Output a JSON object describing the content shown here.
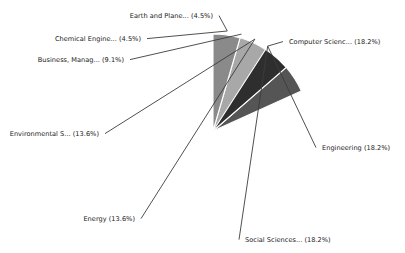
{
  "chart_data": {
    "type": "pie",
    "title": "",
    "xlabel": "",
    "ylabel": "",
    "legend_position": "none",
    "grid": false,
    "label_format": "{name} ({percent}%)",
    "total_percent": 100.0,
    "start_angle": 90,
    "direction": "clockwise",
    "categories": [
      "Computer Scienc...",
      "Engineering",
      "Social Sciences...",
      "Energy",
      "Environmental S...",
      "Business, Manag...",
      "Chemical Engine...",
      "Earth and Plane..."
    ],
    "values": [
      18.2,
      18.2,
      18.2,
      13.6,
      13.6,
      9.1,
      4.5,
      4.5
    ],
    "colors": [
      "#3a3a3a",
      "#262626",
      "#555555",
      "#606060",
      "#2e2e2e",
      "#a8a8a8",
      "#111111",
      "#8a8a8a"
    ],
    "slices": [
      {
        "name": "Computer Scienc...",
        "percent": 18.2,
        "label": "Computer Scienc... (18.2%)",
        "color": "#3a3a3a",
        "label_x": 289,
        "label_y": 44,
        "label_align": "start"
      },
      {
        "name": "Engineering",
        "percent": 18.2,
        "label": "Engineering (18.2%)",
        "color": "#262626",
        "label_x": 322,
        "label_y": 150,
        "label_align": "start"
      },
      {
        "name": "Social Sciences...",
        "percent": 18.2,
        "label": "Social Sciences... (18.2%)",
        "color": "#555555",
        "label_x": 245,
        "label_y": 242,
        "label_align": "start"
      },
      {
        "name": "Energy",
        "percent": 13.6,
        "label": "Energy (13.6%)",
        "color": "#606060",
        "label_x": 135,
        "label_y": 221,
        "label_align": "end"
      },
      {
        "name": "Environmental S...",
        "percent": 13.6,
        "label": "Environmental S... (13.6%)",
        "color": "#2e2e2e",
        "label_x": 99,
        "label_y": 136,
        "label_align": "end"
      },
      {
        "name": "Business, Manag...",
        "percent": 9.1,
        "label": "Business, Manag... (9.1%)",
        "color": "#a8a8a8",
        "label_x": 124,
        "label_y": 62,
        "label_align": "end"
      },
      {
        "name": "Chemical Engine...",
        "percent": 4.5,
        "label": "Chemical Engine... (4.5%)",
        "color": "#111111",
        "label_x": 141,
        "label_y": 41,
        "label_align": "end"
      },
      {
        "name": "Earth and Plane...",
        "percent": 4.5,
        "label": "Earth and Plane... (4.5%)",
        "color": "#8a8a8a",
        "label_x": 213,
        "label_y": 18,
        "label_align": "end"
      }
    ]
  },
  "figure": {
    "background": "#ffffff",
    "center_x": 213,
    "center_y": 131,
    "radius": 97
  }
}
